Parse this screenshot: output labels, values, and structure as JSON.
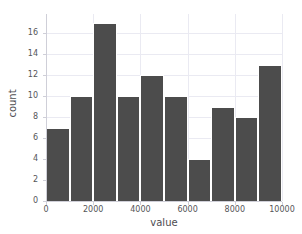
{
  "chart_data": {
    "type": "bar",
    "title": "",
    "xlabel": "value",
    "ylabel": "count",
    "xlim": [
      0,
      10000
    ],
    "ylim": [
      0,
      17.85
    ],
    "grid": true,
    "legend": null,
    "bin_width": 1000,
    "bin_edges": [
      0,
      1000,
      2000,
      3000,
      4000,
      5000,
      6000,
      7000,
      8000,
      9000,
      10000
    ],
    "categories": [
      "0-1000",
      "1000-2000",
      "2000-3000",
      "3000-4000",
      "4000-5000",
      "5000-6000",
      "6000-7000",
      "7000-8000",
      "8000-9000",
      "9000-10000"
    ],
    "values": [
      7,
      10,
      17,
      10,
      12,
      10,
      4,
      9,
      8,
      13
    ],
    "bar_color": "#4c4c4c",
    "bar_edge_color": "#ffffff",
    "background_color": "#ffffff",
    "grid_color": "#eaeaf2",
    "xticks": [
      {
        "value": 0,
        "label": "0"
      },
      {
        "value": 2000,
        "label": "2000"
      },
      {
        "value": 4000,
        "label": "4000"
      },
      {
        "value": 6000,
        "label": "6000"
      },
      {
        "value": 8000,
        "label": "8000"
      },
      {
        "value": 10000,
        "label": "10000"
      }
    ],
    "yticks": [
      {
        "value": 0,
        "label": "0"
      },
      {
        "value": 2,
        "label": "2"
      },
      {
        "value": 4,
        "label": "4"
      },
      {
        "value": 6,
        "label": "6"
      },
      {
        "value": 8,
        "label": "8"
      },
      {
        "value": 10,
        "label": "10"
      },
      {
        "value": 12,
        "label": "12"
      },
      {
        "value": 14,
        "label": "14"
      },
      {
        "value": 16,
        "label": "16"
      }
    ]
  }
}
